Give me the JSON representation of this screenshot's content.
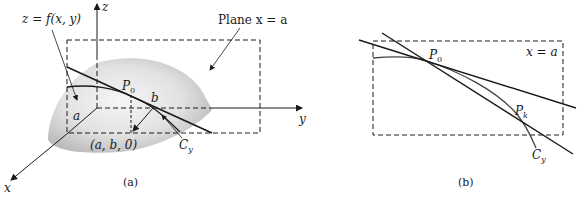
{
  "panel_a": {
    "caption": "(a)",
    "surface_label": "z = f(x, y)",
    "plane_label": "Plane x = a",
    "point_label": "P",
    "point_subscript": "0",
    "b_label": "b",
    "a_label": "a",
    "base_point_label": "(a, b, 0)",
    "curve_label": "C",
    "curve_subscript": "y",
    "axis_x": "x",
    "axis_y": "y",
    "axis_z": "z"
  },
  "panel_b": {
    "caption": "(b)",
    "plane_label": "x = a",
    "p0_label": "P",
    "p0_subscript": "0",
    "pk_label": "P",
    "pk_subscript": "k",
    "curve_label": "C",
    "curve_subscript": "y"
  },
  "colors": {
    "line": "#1a1a1a",
    "surface_light": "#f4f4f4",
    "surface_dark": "#bdbdbd"
  }
}
